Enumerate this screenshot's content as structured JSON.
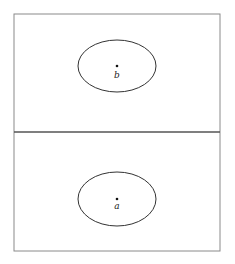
{
  "diagram": {
    "frame": {
      "x": 14,
      "y": 14,
      "width": 206,
      "height": 237,
      "stroke": "#8a8a8a"
    },
    "divider": {
      "y": 132,
      "stroke": "#555555"
    },
    "regions": [
      {
        "name": "upper",
        "ellipse": {
          "cx": 117,
          "cy": 66,
          "rx": 39,
          "ry": 26
        },
        "point": {
          "x": 117,
          "y": 66
        },
        "label": "b",
        "label_pos": {
          "x": 117,
          "y": 78
        }
      },
      {
        "name": "lower",
        "ellipse": {
          "cx": 117,
          "cy": 199,
          "rx": 39,
          "ry": 27
        },
        "point": {
          "x": 117,
          "y": 199
        },
        "label": "a",
        "label_pos": {
          "x": 117,
          "y": 209
        }
      }
    ],
    "colors": {
      "ellipse_stroke": "#333333",
      "point_fill": "#111111"
    }
  }
}
